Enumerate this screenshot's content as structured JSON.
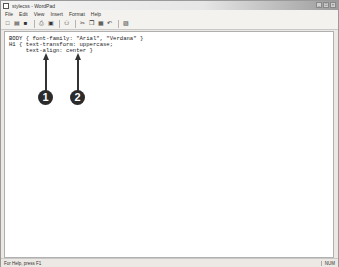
{
  "window": {
    "title": "stylecss - WordPad",
    "controls": [
      "minimize",
      "maximize",
      "close"
    ]
  },
  "menubar": {
    "items": [
      "File",
      "Edit",
      "View",
      "Insert",
      "Format",
      "Help"
    ]
  },
  "toolbar": {
    "buttons": [
      {
        "name": "new-icon",
        "glyph": "□"
      },
      {
        "name": "open-icon",
        "glyph": "▤"
      },
      {
        "name": "save-icon",
        "glyph": "■"
      },
      {
        "name": "print-icon",
        "glyph": "⎙"
      },
      {
        "name": "print-preview-icon",
        "glyph": "▣"
      },
      {
        "name": "find-icon",
        "glyph": "⚇"
      },
      {
        "name": "cut-icon",
        "glyph": "✂"
      },
      {
        "name": "copy-icon",
        "glyph": "❐"
      },
      {
        "name": "paste-icon",
        "glyph": "▦"
      },
      {
        "name": "undo-icon",
        "glyph": "↶"
      },
      {
        "name": "insert-date-icon",
        "glyph": "▨"
      }
    ]
  },
  "document": {
    "lines": [
      "BODY { font-family: \"Arial\", \"Verdana\" }",
      "H1 { text-transform: uppercase;",
      "     text-align: center }"
    ]
  },
  "callouts": [
    {
      "label": "1"
    },
    {
      "label": "2"
    }
  ],
  "statusbar": {
    "help_text": "For Help, press F1",
    "indicator": "NUM"
  }
}
